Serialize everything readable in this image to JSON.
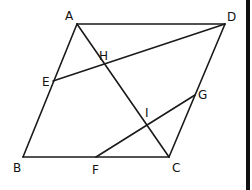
{
  "diagram": {
    "type": "geometry-parallelogram",
    "points": {
      "A": {
        "label": "A",
        "x": 77,
        "y": 24,
        "lx": 65,
        "ly": 20
      },
      "D": {
        "label": "D",
        "x": 225,
        "y": 24,
        "lx": 227,
        "ly": 21
      },
      "B": {
        "label": "B",
        "x": 23,
        "y": 157,
        "lx": 13,
        "ly": 172
      },
      "C": {
        "label": "C",
        "x": 169,
        "y": 157,
        "lx": 172,
        "ly": 172
      },
      "E": {
        "label": "E",
        "x": 53,
        "y": 81,
        "lx": 42,
        "ly": 86
      },
      "H": {
        "label": "H",
        "x": 105,
        "y": 65,
        "lx": 99,
        "ly": 60
      },
      "F": {
        "label": "F",
        "x": 96,
        "y": 157,
        "lx": 92,
        "ly": 174
      },
      "G": {
        "label": "G",
        "x": 195,
        "y": 95,
        "lx": 198,
        "ly": 99
      },
      "I": {
        "label": "I",
        "x": 147,
        "y": 125,
        "lx": 145,
        "ly": 117
      }
    },
    "segments": [
      [
        "A",
        "D"
      ],
      [
        "A",
        "B"
      ],
      [
        "B",
        "C"
      ],
      [
        "D",
        "C"
      ],
      [
        "A",
        "C"
      ],
      [
        "E",
        "D"
      ],
      [
        "F",
        "G"
      ]
    ],
    "colors": {
      "stroke": "#1a1a1a",
      "label": "#111111",
      "edge_bar": "#111111"
    }
  }
}
